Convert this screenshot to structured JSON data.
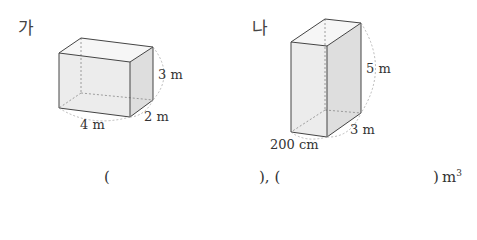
{
  "problem": {
    "figures": [
      {
        "label": "가",
        "shape": "rectangular-prism",
        "dimensions": {
          "width": "4 m",
          "depth": "2 m",
          "height": "3 m"
        }
      },
      {
        "label": "나",
        "shape": "rectangular-prism",
        "dimensions": {
          "width": "200 cm",
          "depth": "3 m",
          "height": "5 m"
        }
      }
    ],
    "answer_line": {
      "open1": "(",
      "close1_sep": "), (",
      "close2": ")",
      "unit": "m",
      "unit_exp": "3"
    }
  }
}
